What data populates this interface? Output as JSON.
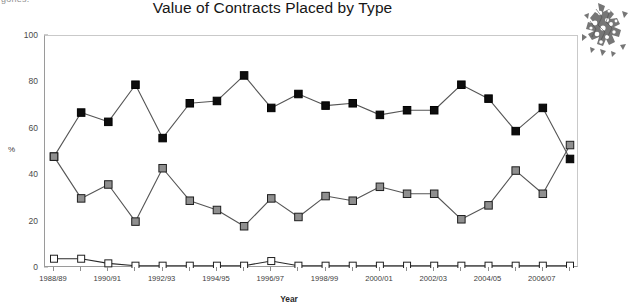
{
  "page": {
    "scrap_text": "gories.",
    "artifact_name": "scanned-clipart-artifact"
  },
  "chart_data": {
    "type": "line",
    "title": "Value of Contracts Placed by Type",
    "xlabel": "Year",
    "ylabel": "%",
    "ylim": [
      0,
      100
    ],
    "yticks": [
      0,
      20,
      40,
      60,
      80,
      100
    ],
    "grid": false,
    "legend": "none",
    "categories": [
      "1988/89",
      "1989/90",
      "1990/91",
      "1991/92",
      "1992/93",
      "1993/94",
      "1994/95",
      "1995/96",
      "1996/97",
      "1997/98",
      "1998/99",
      "1999/00",
      "2000/01",
      "2001/02",
      "2002/03",
      "2003/04",
      "2004/05",
      "2005/06",
      "2006/07",
      "2007/08"
    ],
    "xtick_labels": [
      "1988/89",
      "",
      "1990/91",
      "",
      "1992/93",
      "",
      "1994/95",
      "",
      "1996/97",
      "",
      "1998/99",
      "",
      "2000/01",
      "",
      "2002/03",
      "",
      "2004/05",
      "",
      "2006/07",
      ""
    ],
    "series": [
      {
        "name": "black-filled-square-series",
        "marker": "filled-square",
        "color": "#0d0d0d",
        "values": [
          48,
          67,
          63,
          79,
          56,
          71,
          72,
          83,
          69,
          75,
          70,
          71,
          66,
          68,
          68,
          79,
          73,
          59,
          69,
          47
        ]
      },
      {
        "name": "grey-filled-square-series",
        "marker": "grey-square",
        "color": "#8f8f8f",
        "values": [
          48,
          30,
          36,
          20,
          43,
          29,
          25,
          18,
          30,
          22,
          31,
          29,
          35,
          32,
          32,
          21,
          27,
          42,
          32,
          53
        ]
      },
      {
        "name": "white-open-square-series",
        "marker": "open-square",
        "color": "#ffffff",
        "values": [
          4,
          4,
          2,
          1,
          1,
          1,
          1,
          1,
          3,
          1,
          1,
          1,
          1,
          1,
          1,
          1,
          1,
          1,
          1,
          1
        ]
      }
    ]
  }
}
